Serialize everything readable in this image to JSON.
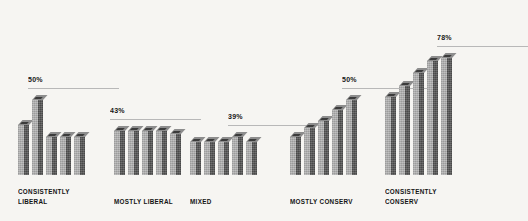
{
  "chart_data": {
    "type": "bar",
    "title": "",
    "subtitle": "",
    "xlabel": "",
    "ylabel": "",
    "grid": false,
    "legend": false,
    "ylim": [
      0,
      100
    ],
    "value_suffix": "%",
    "categories": [
      "CONSISTENTLY\nLIBERAL",
      "MOSTLY LIBERAL",
      "MIXED",
      "MOSTLY CONSERV",
      "CONSISTENTLY\nCONSERV"
    ],
    "peak_labels": [
      "50%",
      "43%",
      "39%",
      "50%",
      "78%"
    ],
    "peak_values": [
      50,
      43,
      39,
      50,
      78
    ],
    "groups": [
      {
        "category": "CONSISTENTLY\nLIBERAL",
        "peak_label": "50%",
        "peak_value": 50,
        "bars": [
          33,
          50,
          25,
          25,
          25
        ]
      },
      {
        "category": "MOSTLY LIBERAL",
        "peak_label": "43%",
        "peak_value": 43,
        "bars": [
          29,
          29,
          29,
          29,
          27
        ]
      },
      {
        "category": "MIXED",
        "peak_label": "39%",
        "peak_value": 39,
        "bars": [
          22,
          22,
          22,
          25,
          22
        ]
      },
      {
        "category": "MOSTLY CONSERV",
        "peak_label": "50%",
        "peak_value": 50,
        "bars": [
          25,
          31,
          36,
          43,
          50
        ]
      },
      {
        "category": "CONSISTENTLY\nCONSERV",
        "peak_label": "78%",
        "peak_value": 78,
        "bars": [
          52,
          59,
          68,
          76,
          78
        ]
      }
    ],
    "colors": {
      "background": "#f6f5f2",
      "bar_left_face": "#adadad",
      "bar_right_face": "#5a5a5a",
      "bar_top_cap": "#8d8d8d",
      "bar_cap_inner": "#3b3b3b",
      "rule": "#b8b8b8",
      "text": "#141414"
    }
  }
}
